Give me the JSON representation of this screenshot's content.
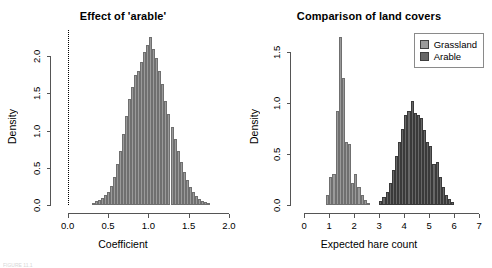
{
  "figure": {
    "footnote": "FIGURE 11.1"
  },
  "chart_data": [
    {
      "type": "bar",
      "id": "effect-of-arable",
      "title": "Effect of 'arable'",
      "xlabel": "Coefficient",
      "ylabel": "Density",
      "xlim": [
        -0.12,
        2.05
      ],
      "ylim": [
        0,
        2.35
      ],
      "xticks": [
        "0.0",
        "0.5",
        "1.0",
        "1.5",
        "2.0"
      ],
      "xtick_values": [
        0.0,
        0.5,
        1.0,
        1.5,
        2.0
      ],
      "yticks": [
        "0.0",
        "0.5",
        "1.0",
        "1.5",
        "2.0"
      ],
      "ytick_values": [
        0.0,
        0.5,
        1.0,
        1.5,
        2.0
      ],
      "grid": false,
      "legend": null,
      "annotations": [
        {
          "kind": "vline",
          "x": 0.0,
          "style": "dotted",
          "color": "#000000"
        }
      ],
      "bin_width": 0.0375,
      "bar_color": "#9a9a9a",
      "bin_starts": [
        0.3,
        0.3375,
        0.375,
        0.4125,
        0.45,
        0.4875,
        0.525,
        0.5625,
        0.6,
        0.6375,
        0.675,
        0.7125,
        0.75,
        0.7875,
        0.825,
        0.8625,
        0.9,
        0.9375,
        0.975,
        1.0125,
        1.05,
        1.0875,
        1.125,
        1.1625,
        1.2,
        1.2375,
        1.275,
        1.3125,
        1.35,
        1.3875,
        1.425,
        1.4625,
        1.5,
        1.5375,
        1.575,
        1.6125,
        1.65,
        1.6875,
        1.725
      ],
      "values": [
        0.03,
        0.05,
        0.07,
        0.1,
        0.13,
        0.18,
        0.26,
        0.38,
        0.55,
        0.72,
        0.95,
        1.2,
        1.42,
        1.58,
        1.75,
        1.8,
        1.92,
        2.05,
        2.15,
        2.25,
        2.1,
        1.98,
        1.8,
        1.62,
        1.4,
        1.22,
        1.05,
        0.88,
        0.72,
        0.58,
        0.44,
        0.33,
        0.24,
        0.17,
        0.12,
        0.08,
        0.06,
        0.04,
        0.02
      ]
    },
    {
      "type": "bar",
      "id": "comparison-of-land-covers",
      "title": "Comparison of land covers",
      "xlabel": "Expected hare count",
      "ylabel": "Density",
      "xlim": [
        -0.25,
        7.15
      ],
      "ylim": [
        0,
        1.72
      ],
      "xticks": [
        "0",
        "1",
        "2",
        "3",
        "4",
        "5",
        "6",
        "7"
      ],
      "xtick_values": [
        0,
        1,
        2,
        3,
        4,
        5,
        6,
        7
      ],
      "yticks": [
        "0.0",
        "0.5",
        "1.0",
        "1.5"
      ],
      "ytick_values": [
        0.0,
        0.5,
        1.0,
        1.5
      ],
      "grid": false,
      "legend": {
        "position": "top-right",
        "entries": [
          {
            "label": "Grassland",
            "color": "#9a9a9a"
          },
          {
            "label": "Arable",
            "color": "#676767"
          }
        ]
      },
      "bin_width": 0.125,
      "series": [
        {
          "name": "Grassland",
          "color": "#9a9a9a",
          "bin_starts": [
            0.875,
            1.0,
            1.125,
            1.25,
            1.375,
            1.5,
            1.625,
            1.75,
            1.875,
            2.0,
            2.125,
            2.25,
            2.375,
            2.5
          ],
          "values": [
            0.1,
            0.28,
            0.3,
            0.92,
            1.65,
            1.25,
            0.62,
            0.6,
            0.22,
            0.3,
            0.18,
            0.1,
            0.05,
            0.02
          ]
        },
        {
          "name": "Arable",
          "color": "#676767",
          "bin_starts": [
            3.0,
            3.125,
            3.25,
            3.375,
            3.5,
            3.625,
            3.75,
            3.875,
            4.0,
            4.125,
            4.25,
            4.375,
            4.5,
            4.625,
            4.75,
            4.875,
            5.0,
            5.125,
            5.25,
            5.375,
            5.5,
            5.625,
            5.75,
            5.875
          ],
          "values": [
            0.04,
            0.08,
            0.13,
            0.22,
            0.34,
            0.48,
            0.62,
            0.75,
            0.88,
            0.92,
            1.02,
            0.9,
            0.88,
            0.86,
            0.74,
            0.62,
            0.58,
            0.4,
            0.42,
            0.28,
            0.18,
            0.1,
            0.06,
            0.03
          ]
        }
      ]
    }
  ]
}
